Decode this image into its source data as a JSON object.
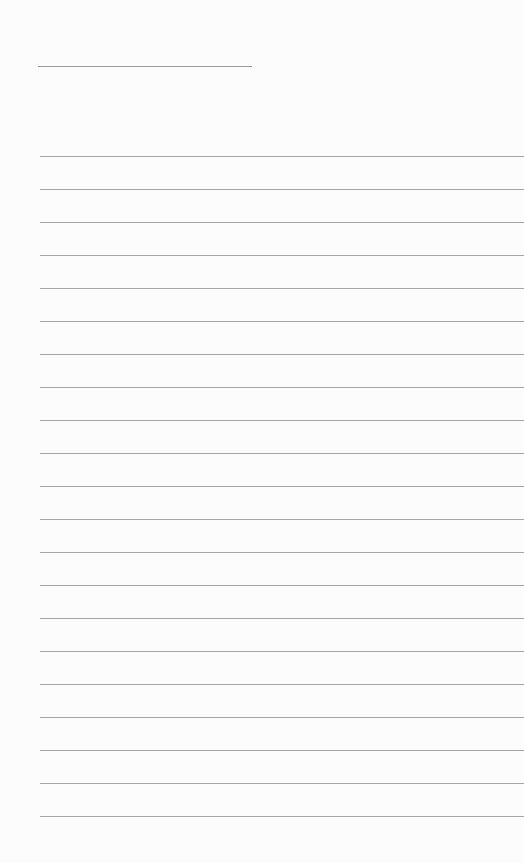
{
  "document": {
    "type": "lined-paper",
    "header_line": {
      "x": 38,
      "y": 66,
      "width": 214
    },
    "rules": {
      "count": 21,
      "start_y": 156,
      "spacing": 33,
      "x": 40
    },
    "colors": {
      "paper": "#fcfcfc",
      "line": "#a5a5a5"
    }
  }
}
